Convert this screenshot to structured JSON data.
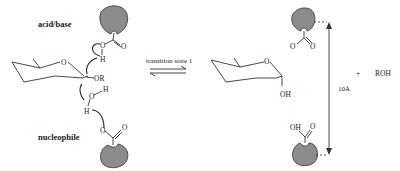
{
  "labels": {
    "acid_base": "acid/base",
    "nucleophile": "nucleophile",
    "transition": "transition state 1",
    "distance": "10Å",
    "plus": "+",
    "product": "ROH"
  },
  "atoms": {
    "ring_o": "O",
    "or": "OR",
    "h_top": "H",
    "o_top": "O",
    "o_top_dbl": "O",
    "o_water": "O",
    "h_water1": "H",
    "h_water2": "H",
    "o_bottom": "O",
    "o_bottom_dbl": "O",
    "prod_ring_o": "O",
    "prod_oh": "OH",
    "prod_o_top": "O",
    "prod_o_top_dbl": "O",
    "prod_o_top_charge": "-",
    "prod_oh_bottom": "OH",
    "prod_o_bottom_dbl": "O"
  },
  "colors": {
    "pocket": "#8c8c8c",
    "ink": "#222222"
  }
}
